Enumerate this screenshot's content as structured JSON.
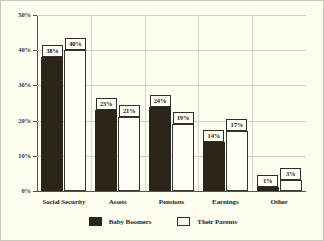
{
  "chart_data": {
    "type": "bar",
    "title": "",
    "subtitle": "",
    "xlabel": "",
    "ylabel": "",
    "ylim": [
      0,
      50
    ],
    "ytick_labels": [
      "0%",
      "10%",
      "20%",
      "30%",
      "40%",
      "50%"
    ],
    "ytick_values": [
      0,
      10,
      20,
      30,
      40,
      50
    ],
    "grid": true,
    "legend_position": "bottom-center",
    "categories": [
      "Social Security",
      "Assets",
      "Pensions",
      "Earnings",
      "Other"
    ],
    "series": [
      {
        "name": "Baby Boomers",
        "color": "#2a2419",
        "values": [
          38,
          23,
          24,
          14,
          1
        ],
        "data_labels": [
          "38%",
          "23%",
          "24%",
          "14%",
          "1%"
        ]
      },
      {
        "name": "Their Parents",
        "color": "#fffff5",
        "values": [
          40,
          21,
          19,
          17,
          3
        ],
        "data_labels": [
          "40%",
          "21%",
          "19%",
          "17%",
          "3%"
        ]
      }
    ]
  },
  "legend": {
    "entries": [
      {
        "label": "Baby Boomers",
        "swatch": "filled-dark-swatch"
      },
      {
        "label": "Their Parents",
        "swatch": "hollow-white-swatch"
      }
    ]
  },
  "colors": {
    "background": "#fdfdf0",
    "series_boomers": "#2a2419",
    "series_parents": "#fffff5",
    "gridline": "#cfcfc2",
    "axis": "#55554a",
    "text": "#2b2b20"
  }
}
